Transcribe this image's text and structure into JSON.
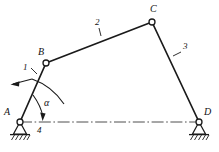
{
  "figure": {
    "type": "four-bar-linkage-kinematic-diagram",
    "background_color": "#ffffff",
    "line_color": "#1a1a1a",
    "joints": [
      {
        "id": "A",
        "label": "A",
        "x": 20,
        "y": 122,
        "kind": "fixed-pivot-ground",
        "label_x": 4,
        "label_y": 107
      },
      {
        "id": "B",
        "label": "B",
        "x": 46,
        "y": 63,
        "kind": "revolute-pin",
        "label_x": 38,
        "label_y": 47
      },
      {
        "id": "C",
        "label": "C",
        "x": 152,
        "y": 22,
        "kind": "revolute-pin",
        "label_x": 150,
        "label_y": 4
      },
      {
        "id": "D",
        "label": "D",
        "x": 199,
        "y": 122,
        "kind": "fixed-pivot-ground",
        "label_x": 204,
        "label_y": 107
      }
    ],
    "links": [
      {
        "id": "1",
        "label": "1",
        "from": "A",
        "to": "B",
        "role": "crank",
        "label_x": 23,
        "label_y": 63,
        "leader": {
          "x1": 31,
          "y1": 68,
          "x2": 37,
          "y2": 74
        }
      },
      {
        "id": "2",
        "label": "2",
        "from": "B",
        "to": "C",
        "role": "coupler",
        "label_x": 95,
        "label_y": 18,
        "leader": {
          "x1": 99,
          "y1": 28,
          "x2": 101,
          "y2": 36
        }
      },
      {
        "id": "3",
        "label": "3",
        "from": "C",
        "to": "D",
        "role": "rocker",
        "label_x": 183,
        "label_y": 42,
        "leader": {
          "x1": 181,
          "y1": 52,
          "x2": 173,
          "y2": 56
        }
      },
      {
        "id": "4",
        "label": "4",
        "from": "A",
        "to": "D",
        "role": "ground-frame",
        "label_x": 37,
        "label_y": 126
      }
    ],
    "angle": {
      "symbol": "α",
      "at_joint": "A",
      "between": [
        "4",
        "1"
      ],
      "label_x": 44,
      "label_y": 98
    },
    "rotation_arrow": {
      "meaning": "crank-rotation-direction",
      "direction": "counterclockwise",
      "tip_x": 11,
      "tip_y": 84
    },
    "centerline": {
      "style": "dash-dot",
      "from_x": 20,
      "to_x": 199,
      "y": 122
    }
  }
}
